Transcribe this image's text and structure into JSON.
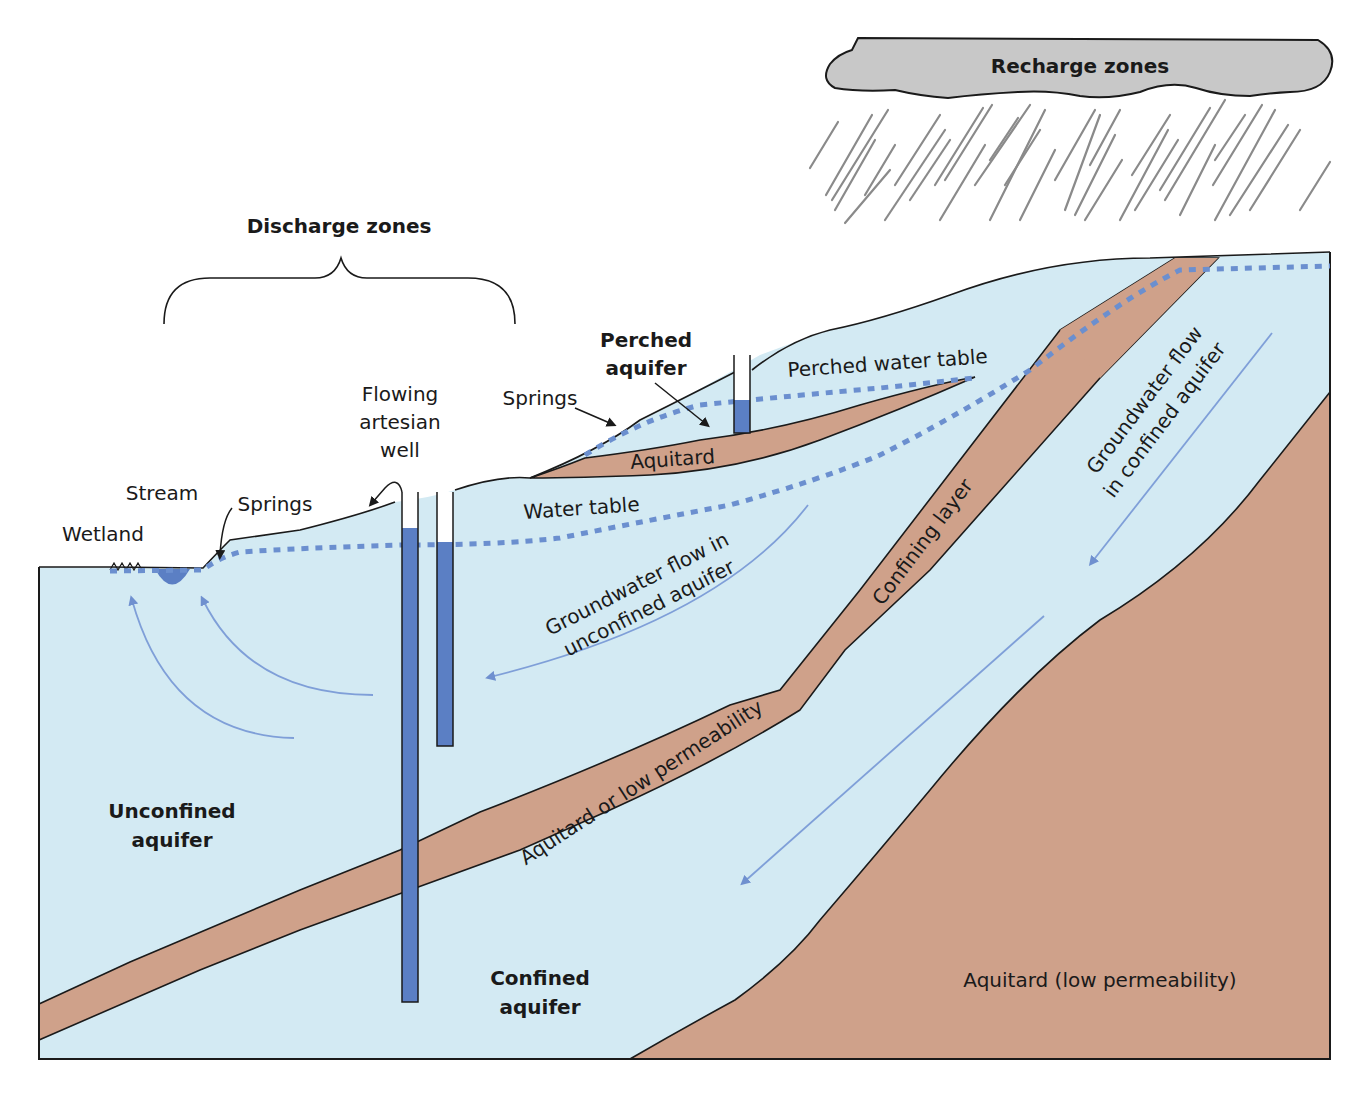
{
  "diagram": {
    "type": "groundwater cross-section",
    "colors": {
      "water": "#d3eaf3",
      "aquitard": "#cfa18a",
      "water_table": "#6b8fcf",
      "well_water": "#5b7fc4",
      "flow_arrow": "#7f9fd8",
      "cloud": "#c8c8c8",
      "rain": "#8a8a8a",
      "outline": "#1a1a1a"
    },
    "cloud_label": "Recharge zones",
    "discharge_label": "Discharge zones",
    "labels": {
      "wetland": "Wetland",
      "stream": "Stream",
      "springs_left": "Springs",
      "flowing_well_line1": "Flowing",
      "flowing_well_line2": "artesian",
      "flowing_well_line3": "well",
      "springs_right": "Springs",
      "perched_aquifer_line1": "Perched",
      "perched_aquifer_line2": "aquifer",
      "perched_water_table": "Perched water table",
      "aquitard_small": "Aquitard",
      "water_table": "Water table",
      "gw_unconfined_line1": "Groundwater flow in",
      "gw_unconfined_line2": "unconfined aquifer",
      "confining_layer": "Confining layer",
      "gw_confined_line1": "Groundwater flow",
      "gw_confined_line2": "in confined aquifer",
      "aquitard_low_perm": "Aquitard or low permeability",
      "unconfined_aquifer_line1": "Unconfined",
      "unconfined_aquifer_line2": "aquifer",
      "confined_aquifer_line1": "Confined",
      "confined_aquifer_line2": "aquifer",
      "aquitard_bottom": "Aquitard (low permeability)"
    }
  }
}
